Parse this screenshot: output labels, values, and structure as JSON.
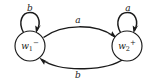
{
  "diagram": {
    "type": "finite-state-automaton",
    "background_color": "#ffffff",
    "stroke_color": "#1a1a1a",
    "states": [
      {
        "id": "w1",
        "label_base": "w",
        "label_subscript": "1",
        "label_superscript": "−",
        "label_full": "w1−",
        "cx": 30,
        "cy": 46,
        "r": 15
      },
      {
        "id": "w2",
        "label_base": "w",
        "label_subscript": "2",
        "label_superscript": "+",
        "label_full": "w2+",
        "cx": 127,
        "cy": 46,
        "r": 15
      }
    ],
    "edges": [
      {
        "id": "loop-w1",
        "kind": "self-loop",
        "from": "w1",
        "to": "w1",
        "label": "b",
        "label_x": 30,
        "label_y": 8
      },
      {
        "id": "loop-w2",
        "kind": "self-loop",
        "from": "w2",
        "to": "w2",
        "label": "a",
        "label_x": 128,
        "label_y": 8
      },
      {
        "id": "arc-top",
        "kind": "arc",
        "from": "w1",
        "to": "w2",
        "label": "a",
        "label_x": 78,
        "label_y": 20
      },
      {
        "id": "arc-bottom",
        "kind": "arc",
        "from": "w2",
        "to": "w1",
        "label": "b",
        "label_x": 78,
        "label_y": 75
      }
    ]
  }
}
